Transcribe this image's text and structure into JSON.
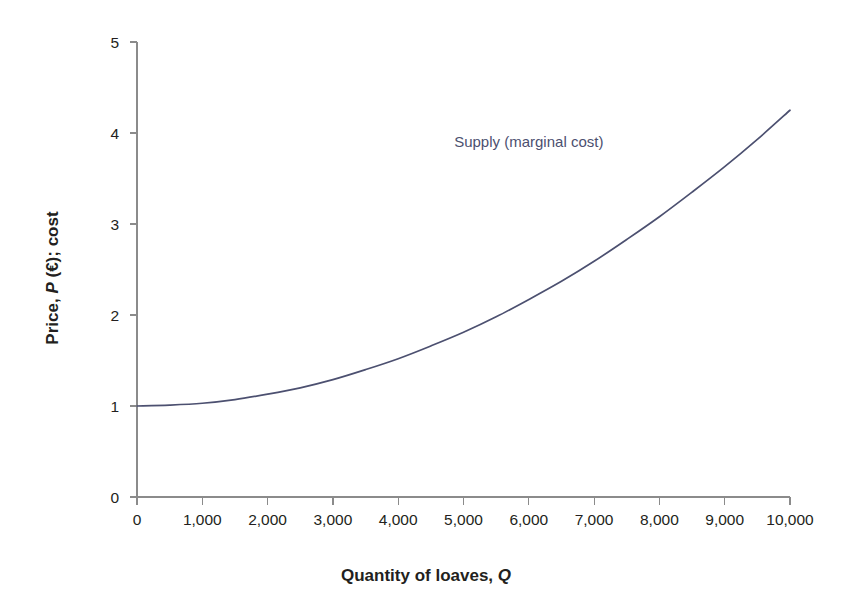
{
  "chart_data": {
    "type": "line",
    "title": "",
    "subtitle": "",
    "xlabel_plain": "Quantity of loaves,",
    "xlabel_symbol": "Q",
    "ylabel_plain_a": "Price,",
    "ylabel_symbol": "P",
    "ylabel_plain_b": "(€); cost",
    "xlim": [
      0,
      10000
    ],
    "ylim": [
      0,
      5
    ],
    "grid": false,
    "legend_position": "inline-annotation",
    "x_ticks": [
      0,
      1000,
      2000,
      3000,
      4000,
      5000,
      6000,
      7000,
      8000,
      9000,
      10000
    ],
    "x_tick_labels": [
      "0",
      "1,000",
      "2,000",
      "3,000",
      "4,000",
      "5,000",
      "6,000",
      "7,000",
      "8,000",
      "9,000",
      "10,000"
    ],
    "y_ticks": [
      0,
      1,
      2,
      3,
      4,
      5
    ],
    "y_tick_labels": [
      "0",
      "1",
      "2",
      "3",
      "4",
      "5"
    ],
    "series": [
      {
        "name": "Supply (marginal cost)",
        "color": "#4c5070",
        "annotation_label": "Supply (marginal cost)",
        "annotation_x": 6000,
        "annotation_y": 3.85,
        "x": [
          0,
          500,
          1000,
          1500,
          2000,
          2500,
          3000,
          3500,
          4000,
          4500,
          5000,
          5500,
          6000,
          6500,
          7000,
          7500,
          8000,
          8500,
          9000,
          9500,
          10000
        ],
        "y": [
          1.0,
          1.01,
          1.03,
          1.07,
          1.13,
          1.2,
          1.29,
          1.4,
          1.52,
          1.66,
          1.81,
          1.98,
          2.17,
          2.37,
          2.59,
          2.83,
          3.08,
          3.35,
          3.63,
          3.93,
          4.25
        ]
      }
    ]
  },
  "figure": {
    "background_color": "#ffffff",
    "axis_color": "#8b8b8b",
    "text_color": "#231f20",
    "accent_color": "#4c5070"
  }
}
